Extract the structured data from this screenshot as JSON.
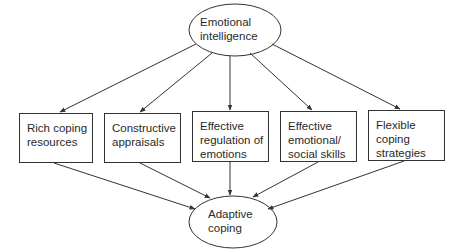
{
  "diagram": {
    "top_node": {
      "lines": [
        "Emotional",
        "intelligence"
      ]
    },
    "middle_nodes": [
      {
        "lines": [
          "Rich coping",
          "resources"
        ]
      },
      {
        "lines": [
          "Constructive",
          "appraisals"
        ]
      },
      {
        "lines": [
          "Effective",
          "regulation of",
          "emotions"
        ]
      },
      {
        "lines": [
          "Effective",
          "emotional/",
          "social skills"
        ]
      },
      {
        "lines": [
          "Flexible",
          "coping",
          "strategies"
        ]
      }
    ],
    "bottom_node": {
      "lines": [
        "Adaptive",
        "coping"
      ]
    },
    "edges": [
      {
        "from": "Emotional intelligence",
        "to": "Rich coping resources"
      },
      {
        "from": "Emotional intelligence",
        "to": "Constructive appraisals"
      },
      {
        "from": "Emotional intelligence",
        "to": "Effective regulation of emotions"
      },
      {
        "from": "Emotional intelligence",
        "to": "Effective emotional/social skills"
      },
      {
        "from": "Emotional intelligence",
        "to": "Flexible coping strategies"
      },
      {
        "from": "Rich coping resources",
        "to": "Adaptive coping"
      },
      {
        "from": "Constructive appraisals",
        "to": "Adaptive coping"
      },
      {
        "from": "Effective regulation of emotions",
        "to": "Adaptive coping"
      },
      {
        "from": "Effective emotional/social skills",
        "to": "Adaptive coping"
      },
      {
        "from": "Flexible coping strategies",
        "to": "Adaptive coping"
      }
    ],
    "colors": {
      "stroke": "#333333",
      "text": "#2a2a2a",
      "background": "#ffffff"
    }
  }
}
